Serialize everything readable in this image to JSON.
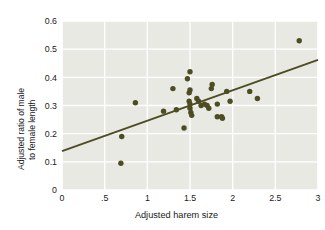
{
  "chart_data": {
    "type": "scatter",
    "title": "",
    "xlabel": "Adjusted harem size",
    "ylabel": "Adjusted ratio of male to female length",
    "ylabel_line1": "Adjusted ratio of male",
    "ylabel_line2": "to female length",
    "xlim": [
      0,
      3
    ],
    "ylim": [
      0,
      0.6
    ],
    "xticks": [
      "0",
      ".5",
      "1",
      "1.5",
      "2",
      "2.5",
      "3"
    ],
    "xtick_values": [
      0,
      0.5,
      1,
      1.5,
      2,
      2.5,
      3
    ],
    "yticks": [
      "0",
      "0.1",
      "0.2",
      "0.3",
      "0.4",
      "0.5",
      "0.6"
    ],
    "ytick_values": [
      0,
      0.1,
      0.2,
      0.3,
      0.4,
      0.5,
      0.6
    ],
    "grid": true,
    "legend": null,
    "marker_color": "#4d4d24",
    "line_color": "#4d4d24",
    "plot_background": "#e9e9e4",
    "gridline_color": "#ffffff",
    "points": [
      [
        0.69,
        0.095
      ],
      [
        0.7,
        0.19
      ],
      [
        0.86,
        0.31
      ],
      [
        1.19,
        0.28
      ],
      [
        1.3,
        0.36
      ],
      [
        1.34,
        0.285
      ],
      [
        1.43,
        0.22
      ],
      [
        1.47,
        0.395
      ],
      [
        1.5,
        0.42
      ],
      [
        1.49,
        0.345
      ],
      [
        1.5,
        0.355
      ],
      [
        1.49,
        0.315
      ],
      [
        1.5,
        0.305
      ],
      [
        1.5,
        0.29
      ],
      [
        1.51,
        0.275
      ],
      [
        1.52,
        0.265
      ],
      [
        1.58,
        0.325
      ],
      [
        1.6,
        0.315
      ],
      [
        1.63,
        0.3
      ],
      [
        1.67,
        0.305
      ],
      [
        1.7,
        0.3
      ],
      [
        1.72,
        0.29
      ],
      [
        1.75,
        0.36
      ],
      [
        1.76,
        0.375
      ],
      [
        1.82,
        0.305
      ],
      [
        1.82,
        0.26
      ],
      [
        1.87,
        0.26
      ],
      [
        1.88,
        0.255
      ],
      [
        1.93,
        0.35
      ],
      [
        1.97,
        0.315
      ],
      [
        2.2,
        0.35
      ],
      [
        2.29,
        0.325
      ],
      [
        2.78,
        0.53
      ]
    ],
    "trendline": {
      "x": [
        0,
        3
      ],
      "y": [
        0.138,
        0.462
      ]
    }
  }
}
